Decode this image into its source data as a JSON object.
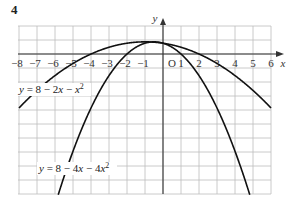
{
  "question_number": "4",
  "chart_data": {
    "type": "line",
    "title": "",
    "xlabel": "x",
    "ylabel": "y",
    "origin_label": "O",
    "x_ticks": [
      -8,
      -7,
      -6,
      -5,
      -4,
      -3,
      -2,
      -1,
      1,
      2,
      3,
      4,
      5,
      6
    ],
    "xlim": [
      -8,
      6
    ],
    "grid": true,
    "series": [
      {
        "name": "y = 8 − 2x − x²",
        "formula": "8-2x-x^2",
        "a": -1,
        "b": -2,
        "c": 8
      },
      {
        "name": "y = 8 − 4x − 4x²",
        "formula": "8-4x-4x^2",
        "a": -4,
        "b": -4,
        "c": 8
      }
    ],
    "labels": {
      "curve1": {
        "prefix": "y = 8 − 2",
        "x": "x",
        "mid": " − ",
        "x2": "x",
        "sup": "2"
      },
      "curve2": {
        "prefix": "y = 8 − 4",
        "x": "x",
        "mid": " − 4",
        "x2": "x",
        "sup": "2"
      }
    }
  }
}
